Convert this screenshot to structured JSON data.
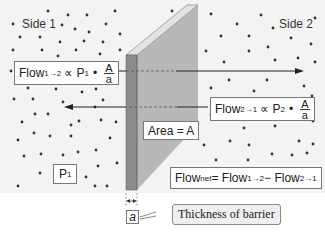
{
  "diagram": {
    "side1_label": "Side 1",
    "side2_label": "Side 2",
    "pressure_label": {
      "base": "P",
      "sub": "1"
    },
    "area_label": "Area = A",
    "flow_1_to_2": {
      "prefix": "Flow",
      "sub": "1→2",
      "relation": "∝ P",
      "p_sub": "1",
      "dot": "•",
      "frac_num": "A",
      "frac_den": "a"
    },
    "flow_2_to_1": {
      "prefix": "Flow",
      "sub": "2→1",
      "relation": "∝ P",
      "p_sub": "2",
      "dot": "•",
      "frac_num": "A",
      "frac_den": "a"
    },
    "flow_net": {
      "prefix": "Flow",
      "sub": "net",
      "eq": " = Flow",
      "sub2": "1→2",
      "minus": " − Flow",
      "sub3": "2→1"
    },
    "thickness_symbol": "a",
    "thickness_callout": "Thickness of barrier",
    "colors": {
      "background": "#f3f3f3",
      "barrier_front": "#b5b5b5",
      "barrier_side": "#8a8a8a",
      "barrier_top": "#dddddd",
      "dot": "#333333",
      "arrow": "#222222"
    }
  }
}
